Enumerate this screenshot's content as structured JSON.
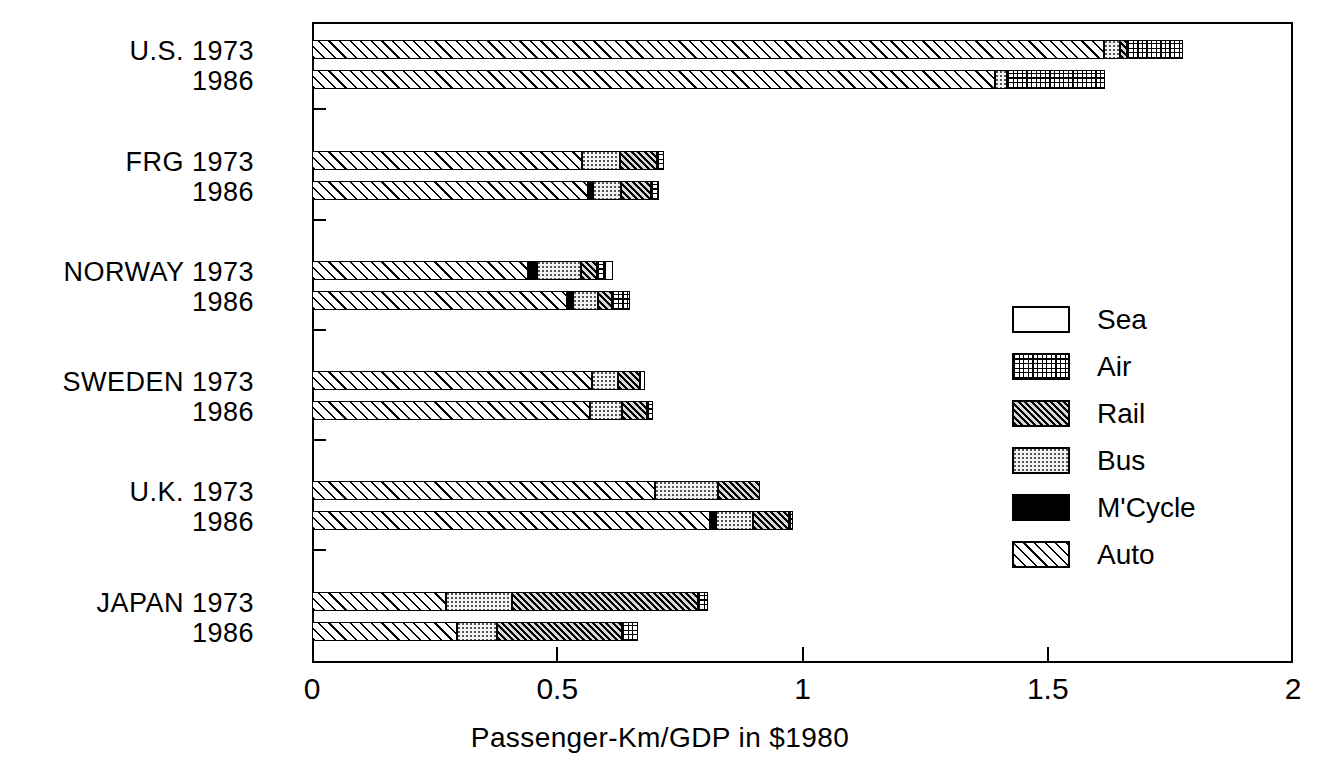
{
  "chart_data": {
    "type": "bar",
    "orientation": "horizontal",
    "stacked": true,
    "title": "",
    "xlabel": "Passenger-Km/GDP in $1980",
    "ylabel": "",
    "xlim": [
      0,
      2
    ],
    "xticks": [
      "0",
      "0.5",
      "1",
      "1.5",
      "2"
    ],
    "xtick_values": [
      0,
      0.5,
      1,
      1.5,
      2
    ],
    "grid": false,
    "legend_position": "inside-right",
    "series": [
      {
        "name": "Auto",
        "key": "auto"
      },
      {
        "name": "M'Cycle",
        "key": "mcycle"
      },
      {
        "name": "Bus",
        "key": "bus"
      },
      {
        "name": "Rail",
        "key": "rail"
      },
      {
        "name": "Air",
        "key": "air"
      },
      {
        "name": "Sea",
        "key": "sea"
      }
    ],
    "groups": [
      {
        "country": "U.S.",
        "rows": [
          {
            "year": "1973",
            "label": "U.S. 1973",
            "auto": 1.615,
            "mcycle": 0.0,
            "bus": 0.033,
            "rail": 0.014,
            "air": 0.114,
            "sea": 0.0,
            "total": 1.776
          },
          {
            "year": "1986",
            "label": "1986",
            "auto": 1.392,
            "mcycle": 0.0,
            "bus": 0.024,
            "rail": 0.0,
            "air": 0.2,
            "sea": 0.0,
            "total": 1.616
          }
        ]
      },
      {
        "country": "FRG",
        "rows": [
          {
            "year": "1973",
            "label": "FRG 1973",
            "auto": 0.55,
            "mcycle": 0.0,
            "bus": 0.078,
            "rail": 0.075,
            "air": 0.014,
            "sea": 0.0,
            "total": 0.717
          },
          {
            "year": "1986",
            "label": "1986",
            "auto": 0.563,
            "mcycle": 0.01,
            "bus": 0.057,
            "rail": 0.061,
            "air": 0.016,
            "sea": 0.0,
            "total": 0.707
          }
        ]
      },
      {
        "country": "NORWAY",
        "rows": [
          {
            "year": "1973",
            "label": "NORWAY 1973",
            "auto": 0.44,
            "mcycle": 0.018,
            "bus": 0.09,
            "rail": 0.033,
            "air": 0.016,
            "sea": 0.016,
            "total": 0.613
          },
          {
            "year": "1986",
            "label": "1986",
            "auto": 0.52,
            "mcycle": 0.012,
            "bus": 0.051,
            "rail": 0.029,
            "air": 0.037,
            "sea": 0.0,
            "total": 0.649
          }
        ]
      },
      {
        "country": "SWEDEN",
        "rows": [
          {
            "year": "1973",
            "label": "SWEDEN 1973",
            "auto": 0.571,
            "mcycle": 0.0,
            "bus": 0.053,
            "rail": 0.045,
            "air": 0.0,
            "sea": 0.01,
            "total": 0.679
          },
          {
            "year": "1986",
            "label": "1986",
            "auto": 0.567,
            "mcycle": 0.0,
            "bus": 0.065,
            "rail": 0.051,
            "air": 0.012,
            "sea": 0.0,
            "total": 0.695
          }
        ]
      },
      {
        "country": "U.K.",
        "rows": [
          {
            "year": "1973",
            "label": "U.K. 1973",
            "auto": 0.7,
            "mcycle": 0.0,
            "bus": 0.128,
            "rail": 0.086,
            "air": 0.0,
            "sea": 0.0,
            "total": 0.914
          },
          {
            "year": "1986",
            "label": "1986",
            "auto": 0.812,
            "mcycle": 0.012,
            "bus": 0.075,
            "rail": 0.073,
            "air": 0.008,
            "sea": 0.0,
            "total": 0.98
          }
        ]
      },
      {
        "country": "JAPAN",
        "rows": [
          {
            "year": "1973",
            "label": "JAPAN 1973",
            "auto": 0.273,
            "mcycle": 0.0,
            "bus": 0.135,
            "rail": 0.379,
            "air": 0.02,
            "sea": 0.0,
            "total": 0.807
          },
          {
            "year": "1986",
            "label": "1986",
            "auto": 0.296,
            "mcycle": 0.0,
            "bus": 0.082,
            "rail": 0.255,
            "air": 0.031,
            "sea": 0.0,
            "total": 0.663
          }
        ]
      }
    ]
  },
  "legend": {
    "items": [
      {
        "label": "Sea",
        "pattern": "sea"
      },
      {
        "label": "Air",
        "pattern": "air"
      },
      {
        "label": "Rail",
        "pattern": "rail"
      },
      {
        "label": "Bus",
        "pattern": "bus"
      },
      {
        "label": "M'Cycle",
        "pattern": "mcycle"
      },
      {
        "label": "Auto",
        "pattern": "auto"
      }
    ]
  },
  "axis": {
    "x_title": "Passenger-Km/GDP in $1980",
    "x_tick_labels": [
      "0",
      "0.5",
      "1",
      "1.5",
      "2"
    ]
  }
}
